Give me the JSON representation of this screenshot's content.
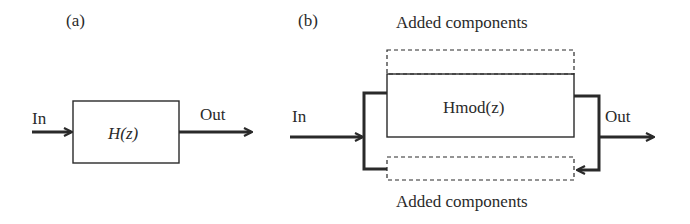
{
  "panels": [
    {
      "id": "a",
      "label": "(a)",
      "input_label": "In",
      "output_label": "Out",
      "block_label": "H(z)"
    },
    {
      "id": "b",
      "label": "(b)",
      "input_label": "In",
      "output_label": "Out",
      "block_label": "Hmod(z)",
      "top_added_label": "Added components",
      "bottom_added_label": "Added components"
    }
  ],
  "colors": {
    "line": "#2a2a2a",
    "background": "#ffffff"
  }
}
